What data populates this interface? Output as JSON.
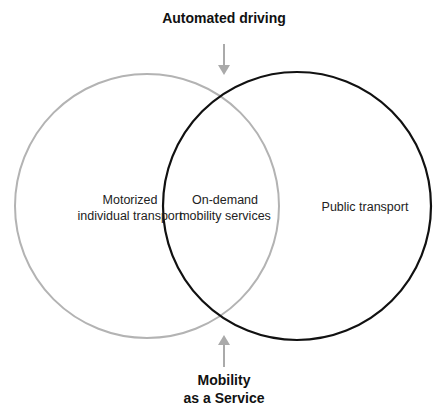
{
  "diagram": {
    "type": "venn",
    "top_label": "Automated driving",
    "bottom_label": [
      "Mobility",
      "as a Service"
    ],
    "sets": [
      {
        "name": "left",
        "label": [
          "Motorized",
          "individual transport"
        ],
        "stroke": "#b3b3b3"
      },
      {
        "name": "right",
        "label": [
          "Public transport"
        ],
        "stroke": "#111111"
      }
    ],
    "intersection": {
      "label": [
        "On-demand",
        "mobility services"
      ]
    },
    "arrow_color": "#aaaaaa"
  }
}
